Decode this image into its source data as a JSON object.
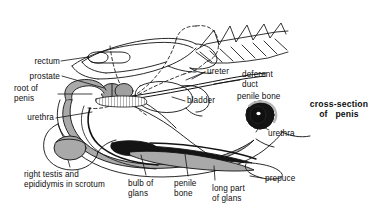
{
  "figure": {
    "background_color": "#ffffff",
    "line_color": "#111111",
    "shade_color": "#a9a9a9",
    "dark_fill_color": "#111111"
  },
  "labels": {
    "rectum": "rectum",
    "prostate": "prostate",
    "root_of_penis": "root of\npenis",
    "urethra_left": "urethra",
    "right_testis": "right testis and\nepididymis in scrotum",
    "bulb_of_glans": "bulb of\nglans",
    "penile_bone_lower": "penile\nbone",
    "long_part_of_glans": "long part\nof glans",
    "prepuce": "prepuce",
    "ureter": "ureter",
    "bladder": "bladder",
    "deferent_duct": "deferent\nduct",
    "penile_bone_inset": "penile bone",
    "urethra_inset": "urethra",
    "cross_section_line1": "cross-section",
    "cross_section_line2": "of   penis"
  },
  "inset": {
    "name": "cross-section-of-penis",
    "parts": [
      "penile bone",
      "urethra"
    ]
  },
  "structures": [
    "rectum",
    "prostate",
    "root of penis",
    "urethra",
    "right testis and epididymis in scrotum",
    "bulb of glans",
    "penile bone",
    "long part of glans",
    "prepuce",
    "ureter",
    "bladder",
    "deferent duct",
    "pelvic bone",
    "sacrum and caudal vertebrae"
  ]
}
